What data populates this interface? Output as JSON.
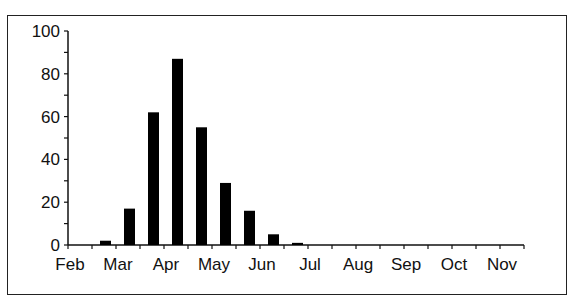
{
  "chart_data": {
    "type": "bar",
    "title": "",
    "xlabel": "",
    "ylabel": "",
    "ylim": [
      0,
      100
    ],
    "yticks": [
      0,
      20,
      40,
      60,
      80,
      100
    ],
    "month_labels": [
      "Feb",
      "Mar",
      "Apr",
      "May",
      "Jun",
      "Jul",
      "Aug",
      "Sep",
      "Oct",
      "Nov"
    ],
    "categories": [
      "Feb-1",
      "Feb-2",
      "Mar-1",
      "Mar-2",
      "Apr-1",
      "Apr-2",
      "May-1",
      "May-2",
      "Jun-1",
      "Jun-2",
      "Jul-1",
      "Jul-2",
      "Aug-1",
      "Aug-2",
      "Sep-1",
      "Sep-2",
      "Oct-1",
      "Oct-2",
      "Nov-1"
    ],
    "values": [
      0,
      2,
      17,
      62,
      87,
      55,
      29,
      16,
      5,
      1,
      0,
      0,
      0,
      0,
      0,
      0,
      0,
      0,
      0
    ],
    "bar_color": "#000000",
    "grid": false,
    "legend": null
  }
}
